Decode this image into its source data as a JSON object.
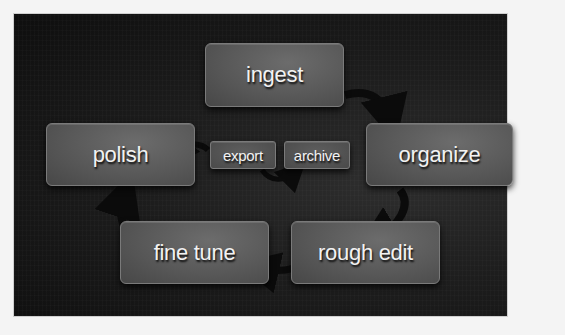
{
  "diagram": {
    "type": "cycle-flow",
    "colors": {
      "background": "#f4f4f4",
      "panel": "#141414",
      "node_fill": "#5a5a5a",
      "node_border": "#7a7a7a",
      "text": "#f2f2f2",
      "arrow": "#0b0b0b"
    },
    "nodes": [
      {
        "id": "ingest",
        "label": "ingest"
      },
      {
        "id": "organize",
        "label": "organize"
      },
      {
        "id": "rough_edit",
        "label": "rough edit"
      },
      {
        "id": "fine_tune",
        "label": "fine tune"
      },
      {
        "id": "polish",
        "label": "polish"
      },
      {
        "id": "export",
        "label": "export"
      },
      {
        "id": "archive",
        "label": "archive"
      }
    ],
    "edges": [
      {
        "from": "ingest",
        "to": "organize"
      },
      {
        "from": "organize",
        "to": "rough_edit"
      },
      {
        "from": "rough_edit",
        "to": "fine_tune"
      },
      {
        "from": "fine_tune",
        "to": "polish"
      },
      {
        "from": "export",
        "to": "polish"
      },
      {
        "from": "export",
        "to": "archive"
      }
    ]
  }
}
